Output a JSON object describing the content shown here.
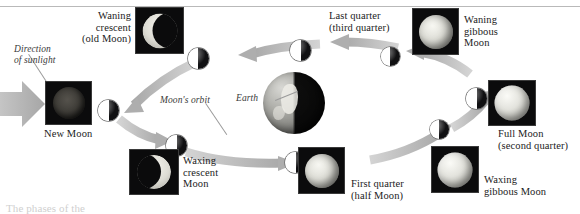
{
  "figure": {
    "type": "lunar-phase-diagram",
    "caption_fragment": "The phases of the",
    "colors": {
      "lit_side": "#ffffff",
      "dark_side": "#101012",
      "arrow_gray": "#b0b0b0",
      "rule_gray": "#b9b9b9",
      "text": "#1b1b1b"
    }
  },
  "annotations": {
    "direction_of_sunlight": "Direction\nof sunlight",
    "moons_orbit": "Moon's orbit",
    "earth": "Earth"
  },
  "phases": [
    {
      "id": "new-moon",
      "label": "New Moon",
      "photo": "new-moon-photo",
      "orbit_position": "left"
    },
    {
      "id": "waxing-crescent",
      "label": "Waxing\ncrescent\nMoon",
      "photo": "waxing-crescent-photo",
      "orbit_position": "lower-left"
    },
    {
      "id": "first-quarter",
      "label": "First quarter\n(half Moon)",
      "photo": "first-quarter-photo",
      "orbit_position": "bottom"
    },
    {
      "id": "waxing-gibbous",
      "label": "Waxing\ngibbous Moon",
      "photo": "waxing-gibbous-photo",
      "orbit_position": "lower-right"
    },
    {
      "id": "full-moon",
      "label": "Full Moon\n(second quarter)",
      "photo": "full-moon-photo",
      "orbit_position": "right"
    },
    {
      "id": "waning-gibbous",
      "label": "Waning\ngibbous\nMoon",
      "photo": "waning-gibbous-photo",
      "orbit_position": "upper-right"
    },
    {
      "id": "last-quarter",
      "label": "Last quarter\n(third quarter)",
      "photo": "last-quarter-photo",
      "orbit_position": "top"
    },
    {
      "id": "waning-crescent",
      "label": "Waning\ncrescent\n(old Moon)",
      "photo": "waning-crescent-photo",
      "orbit_position": "upper-left"
    }
  ]
}
